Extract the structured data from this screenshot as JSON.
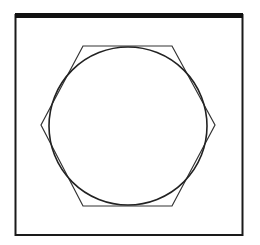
{
  "diagram": {
    "colors": {
      "background": "#ffffff",
      "frame": "#1a1a1a",
      "top_bar": "#111111",
      "hexagon": "#333333",
      "circle": "#222222"
    },
    "frame": {
      "x": 15.5,
      "y": 15,
      "width": 227,
      "height": 220
    },
    "top_bar": {
      "x": 15,
      "y": 13,
      "width": 228,
      "height": 5
    },
    "hexagon": {
      "points": [
        [
          83,
          46
        ],
        [
          172,
          46
        ],
        [
          215,
          125
        ],
        [
          172,
          206
        ],
        [
          83,
          206
        ],
        [
          41,
          125
        ]
      ]
    },
    "circle": {
      "cx": 128,
      "cy": 126,
      "r": 79
    }
  }
}
